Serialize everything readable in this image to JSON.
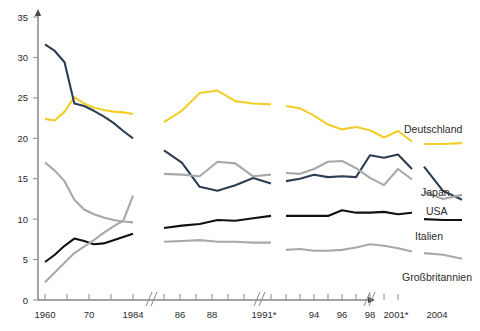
{
  "chart_data": {
    "type": "line",
    "title": "",
    "subtitle": "",
    "xlabel": "",
    "ylabel": "",
    "ylim": [
      0,
      35
    ],
    "yticks": [
      0,
      5,
      10,
      15,
      20,
      25,
      30,
      35
    ],
    "ytick_labels": [
      "0",
      "5",
      "10",
      "15",
      "20",
      "25",
      "30",
      "35"
    ],
    "grid": false,
    "legend_position": "right-inline",
    "axis_breaks": [
      "between 1984 and 1985",
      "between 1991* and 1992",
      "between 2001* and 2002"
    ],
    "xtick_labels": [
      "1960",
      "70",
      "1984",
      "86",
      "88",
      "1991*",
      "94",
      "96",
      "98",
      "2001*",
      "2004"
    ],
    "x_segments": [
      {
        "name": "1960-1984",
        "x": [
          "1960",
          "1965",
          "1970",
          "1972",
          "1974",
          "1976",
          "1978",
          "1980",
          "1982",
          "1984"
        ]
      },
      {
        "name": "1985-1991",
        "x": [
          "1985",
          "1986",
          "1987",
          "1988",
          "1989",
          "1990",
          "1991"
        ]
      },
      {
        "name": "1992-2001",
        "x": [
          "1992",
          "1993",
          "1994",
          "1995",
          "1996",
          "1997",
          "1998",
          "1999",
          "2000",
          "2001"
        ]
      },
      {
        "name": "2002-2004",
        "x": [
          "2002",
          "2003",
          "2004"
        ]
      }
    ],
    "series": [
      {
        "name": "Deutschland",
        "color": "#f2ce2b",
        "label": "Deutschland",
        "segments": [
          [
            22.4,
            22.2,
            23.3,
            25.1,
            24.3,
            23.8,
            23.5,
            23.3,
            23.2,
            23.0
          ],
          [
            22.0,
            23.4,
            25.6,
            25.9,
            24.6,
            24.3,
            24.2
          ],
          [
            24.0,
            23.7,
            22.8,
            21.7,
            21.1,
            21.4,
            21.0,
            20.1,
            20.9,
            19.6
          ],
          [
            19.3,
            19.3,
            19.4
          ]
        ]
      },
      {
        "name": "Japan",
        "color": "#2e3d52",
        "label": "Japan",
        "segments": [
          [
            31.6,
            30.8,
            29.4,
            24.3,
            24.0,
            23.4,
            22.7,
            21.9,
            20.9,
            20.0
          ],
          [
            18.5,
            17.0,
            14.0,
            13.5,
            14.2,
            15.1,
            14.4
          ],
          [
            14.7,
            15.0,
            15.5,
            15.2,
            15.3,
            15.2,
            17.9,
            17.6,
            18.0,
            16.2
          ],
          [
            16.5,
            13.5,
            12.4
          ]
        ]
      },
      {
        "name": "USA",
        "color": "#a8a8a8",
        "label": "USA",
        "segments": [
          [
            17.0,
            16.0,
            14.7,
            12.4,
            11.2,
            10.6,
            10.2,
            9.9,
            9.7,
            9.6
          ],
          [
            15.6,
            15.5,
            15.3,
            17.1,
            16.9,
            15.3,
            15.5
          ],
          [
            15.7,
            15.6,
            16.2,
            17.1,
            17.2,
            16.3,
            15.1,
            14.2,
            16.2,
            14.9
          ],
          [
            13.4,
            12.5,
            13.0
          ]
        ]
      },
      {
        "name": "Italien",
        "color": "#111111",
        "label": "Italien",
        "segments": [
          [
            4.7,
            5.6,
            6.7,
            7.6,
            7.3,
            6.9,
            7.0,
            7.4,
            7.8,
            8.2
          ],
          [
            8.9,
            9.2,
            9.4,
            9.9,
            9.8,
            10.1,
            10.4
          ],
          [
            10.4,
            10.4,
            10.4,
            10.4,
            11.1,
            10.8,
            10.8,
            10.9,
            10.6,
            10.8
          ],
          [
            10.0,
            9.9,
            9.9
          ]
        ]
      },
      {
        "name": "Großbritannien",
        "color": "#a8a8a8",
        "label": "Großbritannien",
        "segments": [
          [
            2.2,
            3.4,
            4.6,
            5.8,
            6.6,
            7.4,
            8.3,
            9.1,
            9.8,
            12.9
          ],
          [
            7.2,
            7.3,
            7.4,
            7.2,
            7.2,
            7.1,
            7.1
          ],
          [
            6.2,
            6.3,
            6.1,
            6.1,
            6.2,
            6.5,
            6.9,
            6.7,
            6.4,
            6.0
          ],
          [
            5.8,
            5.6,
            5.1
          ]
        ]
      }
    ]
  },
  "labels": {
    "deutschland": "Deutschland",
    "japan": "Japan",
    "usa": "USA",
    "italien": "Italien",
    "grossbritannien": "Großbritannien"
  },
  "ytick": {
    "t0": "0",
    "t1": "5",
    "t2": "10",
    "t3": "15",
    "t4": "20",
    "t5": "25",
    "t6": "30",
    "t7": "35"
  },
  "xtick": {
    "x0": "1960",
    "x1": "70",
    "x2": "1984",
    "x3": "86",
    "x4": "88",
    "x5": "1991*",
    "x6": "94",
    "x7": "96",
    "x8": "98",
    "x9": "2001*",
    "x10": "2004"
  },
  "colors": {
    "deutschland": "#f2ce2b",
    "japan": "#2e3d52",
    "usa": "#a8a8a8",
    "italien": "#111111",
    "grossbritannien": "#a8a8a8",
    "axis": "#4a4a4a",
    "tick": "#8a8a8a",
    "text": "#2b2b2b",
    "background": "#ffffff"
  }
}
